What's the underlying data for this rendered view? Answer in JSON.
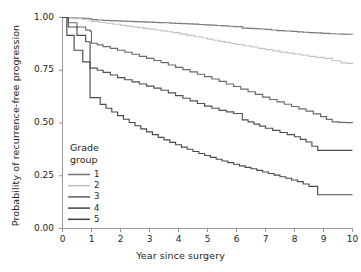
{
  "chart_data": {
    "type": "line",
    "title": "",
    "xlabel": "Year since surgery",
    "ylabel": "Probability of recurrence-free progression",
    "xlim": [
      0,
      10
    ],
    "ylim": [
      0,
      1
    ],
    "xticks": [
      "0",
      "1",
      "2",
      "3",
      "4",
      "5",
      "6",
      "7",
      "8",
      "9",
      "10"
    ],
    "yticks": [
      "0.00",
      "0.25",
      "0.50",
      "0.75",
      "1.00"
    ],
    "grid": false,
    "legend": {
      "title_line1": "Grade",
      "title_line2": "group",
      "position": "inside-lower-left",
      "entries": [
        {
          "label": "1",
          "color": "#7a7a7a"
        },
        {
          "label": "2",
          "color": "#c3c3c3"
        },
        {
          "label": "3",
          "color": "#6a6a6a"
        },
        {
          "label": "4",
          "color": "#4f4f4f"
        },
        {
          "label": "5",
          "color": "#4a4a4a"
        }
      ]
    },
    "series": [
      {
        "name": "1",
        "color": "#7a7a7a",
        "final_value": 0.92,
        "x": [
          0,
          0.35,
          0.9,
          1.0,
          1.6,
          2.2,
          2.9,
          3.5,
          4.1,
          4.7,
          5.3,
          5.9,
          6.2,
          6.6,
          7.0,
          7.4,
          7.9,
          8.3,
          8.7,
          9.2,
          9.6,
          10
        ],
        "y": [
          1.0,
          0.998,
          0.995,
          0.99,
          0.985,
          0.982,
          0.978,
          0.975,
          0.971,
          0.967,
          0.962,
          0.957,
          0.95,
          0.947,
          0.944,
          0.938,
          0.934,
          0.93,
          0.927,
          0.923,
          0.921,
          0.92
        ]
      },
      {
        "name": "2",
        "color": "#c3c3c3",
        "final_value": 0.78,
        "x": [
          0,
          0.4,
          0.9,
          1.0,
          1.5,
          2.0,
          2.6,
          3.2,
          3.8,
          4.3,
          4.8,
          5.2,
          5.6,
          6.0,
          6.5,
          7.0,
          7.5,
          8.0,
          8.5,
          9.0,
          9.3,
          9.6,
          10
        ],
        "y": [
          1.0,
          0.995,
          0.988,
          0.982,
          0.973,
          0.963,
          0.952,
          0.941,
          0.928,
          0.915,
          0.903,
          0.892,
          0.882,
          0.872,
          0.86,
          0.848,
          0.836,
          0.826,
          0.816,
          0.806,
          0.795,
          0.785,
          0.78
        ]
      },
      {
        "name": "3",
        "color": "#6a6a6a",
        "final_value": 0.5,
        "x": [
          0,
          0.2,
          0.5,
          0.8,
          0.95,
          1.0,
          1.4,
          1.9,
          2.4,
          2.9,
          3.4,
          3.9,
          4.4,
          4.9,
          5.4,
          5.9,
          6.4,
          6.9,
          7.4,
          7.9,
          8.4,
          8.9,
          9.3,
          10
        ],
        "y": [
          1.0,
          0.975,
          0.955,
          0.94,
          0.935,
          0.878,
          0.862,
          0.845,
          0.826,
          0.806,
          0.786,
          0.764,
          0.742,
          0.72,
          0.697,
          0.673,
          0.648,
          0.623,
          0.6,
          0.578,
          0.556,
          0.53,
          0.505,
          0.5
        ]
      },
      {
        "name": "4",
        "color": "#4f4f4f",
        "final_value": 0.37,
        "x": [
          0,
          0.2,
          0.5,
          0.8,
          0.95,
          1.0,
          1.4,
          1.9,
          2.4,
          2.9,
          3.4,
          3.9,
          4.4,
          4.9,
          5.4,
          5.9,
          6.2,
          6.6,
          7.0,
          7.5,
          8.0,
          8.4,
          8.8,
          10
        ],
        "y": [
          1.0,
          0.955,
          0.915,
          0.885,
          0.875,
          0.76,
          0.74,
          0.715,
          0.695,
          0.675,
          0.655,
          0.63,
          0.605,
          0.58,
          0.56,
          0.545,
          0.515,
          0.495,
          0.475,
          0.455,
          0.435,
          0.41,
          0.37,
          0.37
        ]
      },
      {
        "name": "5",
        "color": "#4a4a4a",
        "final_value": 0.16,
        "x": [
          0,
          0.15,
          0.4,
          0.7,
          0.95,
          1.0,
          1.3,
          1.7,
          2.1,
          2.5,
          2.9,
          3.3,
          3.7,
          4.1,
          4.5,
          4.9,
          5.3,
          5.7,
          6.1,
          6.5,
          6.9,
          7.3,
          7.7,
          8.1,
          8.5,
          8.8,
          10
        ],
        "y": [
          1.0,
          0.915,
          0.845,
          0.79,
          0.762,
          0.62,
          0.588,
          0.552,
          0.518,
          0.487,
          0.458,
          0.432,
          0.408,
          0.386,
          0.365,
          0.346,
          0.328,
          0.312,
          0.297,
          0.283,
          0.268,
          0.253,
          0.238,
          0.222,
          0.2,
          0.16,
          0.16
        ]
      }
    ]
  }
}
